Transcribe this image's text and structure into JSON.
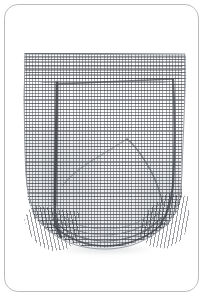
{
  "frame": {
    "border_color": "#b9bcbd",
    "background": "#ffffff",
    "corner_radius_px": 14,
    "alt": "Rounded rectangle product card frame"
  },
  "photo": {
    "subject": "waffle-knit garment",
    "description": "Light gray waffle / mesh knit shorts photographed flat on a white background",
    "background_color": "#ffffff",
    "fabric_color": "#fbfbfc",
    "weave_line_color": "#585c62",
    "outline_color": "#8e9398",
    "shadow_color": "#787e86",
    "weave": {
      "type": "waffle-grid",
      "pitch_px": 3,
      "course_emphasis_px": 6
    },
    "features": [
      {
        "name": "waistband-yoke",
        "position": "top",
        "note": "denser horizontal courses"
      },
      {
        "name": "left-seam",
        "position": "left",
        "note": "dark vertical side seam"
      },
      {
        "name": "right-seam",
        "position": "right",
        "note": "dark vertical side seam"
      },
      {
        "name": "diagonal-fold",
        "position": "center-right",
        "note": "drape crease"
      },
      {
        "name": "hem-band",
        "position": "bottom",
        "note": "curved ribbed hem bands"
      },
      {
        "name": "left-rib-gather",
        "position": "bottom-left",
        "note": "gathered rib panel"
      },
      {
        "name": "right-rib-gather",
        "position": "bottom-right",
        "note": "gathered rib panel"
      }
    ]
  }
}
